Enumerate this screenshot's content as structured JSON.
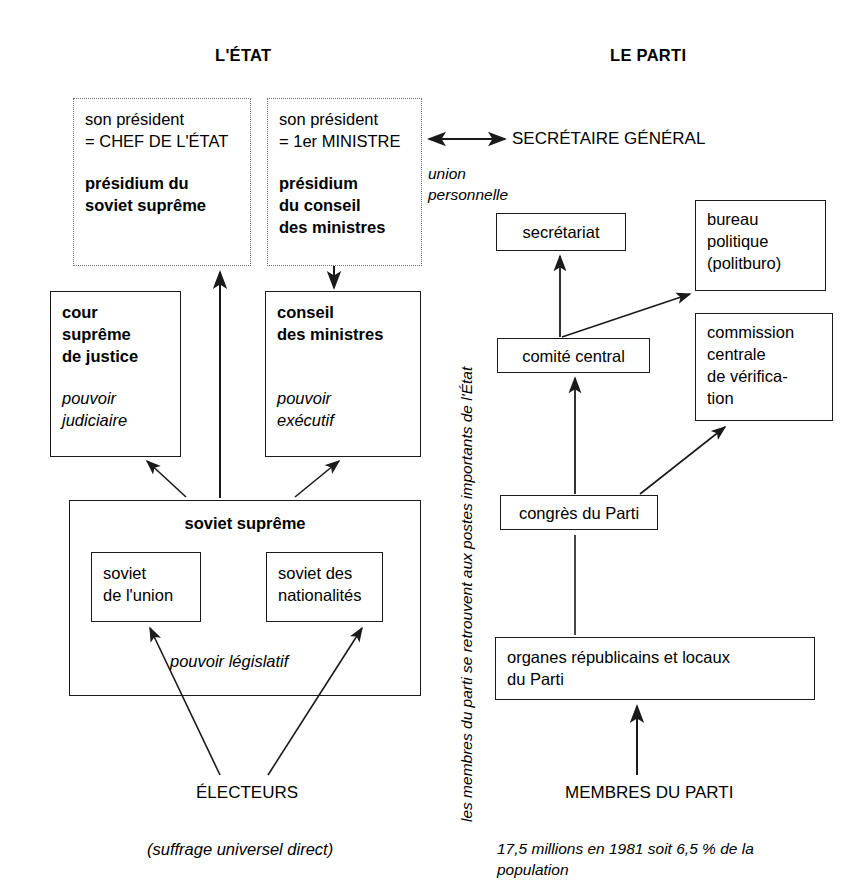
{
  "diagram": {
    "headings": {
      "state": "L'ÉTAT",
      "party": "LE PARTI"
    },
    "state_side": {
      "presidium_soviet": {
        "line1": "son président",
        "line2": "= CHEF DE L'ÉTAT",
        "name": "présidium du\nsoviet suprême"
      },
      "presidium_conseil": {
        "line1": "son président",
        "line2": "= 1er MINISTRE",
        "name": "présidium\ndu conseil\ndes ministres"
      },
      "cour_supreme": {
        "name": "cour\nsuprême\nde justice",
        "power": "pouvoir\njudiciaire"
      },
      "conseil_ministres": {
        "name": "conseil\ndes ministres",
        "power": "pouvoir\nexécutif"
      },
      "soviet_supreme": {
        "name": "soviet suprême",
        "chamber_union": "soviet\nde l'union",
        "chamber_nationalites": "soviet des\nnationalités",
        "power": "pouvoir législatif"
      },
      "electeurs": "ÉLECTEURS",
      "electeurs_note": "(suffrage universel direct)"
    },
    "party_side": {
      "secretaire_general": "SECRÉTAIRE GÉNÉRAL",
      "union_personnelle": "union\npersonnelle",
      "secretariat": "secrétariat",
      "bureau_politique": "bureau\npolitique\n(politburo)",
      "comite_central": "comité central",
      "commission_centrale": "commission\ncentrale\nde vérifica-\ntion",
      "congres": "congrès du Parti",
      "organes_locaux": "organes républicains et locaux\ndu Parti",
      "membres": "MEMBRES DU PARTI",
      "membres_note": "17,5 millions en 1981 soit 6,5 % de la\npopulation"
    },
    "middle_annotation": "les membres du parti se retrouvent aux postes importants de l'État",
    "colors": {
      "ink": "#1a1a1a",
      "dotted_border": "#6f6f6f",
      "background": "#ffffff"
    }
  }
}
